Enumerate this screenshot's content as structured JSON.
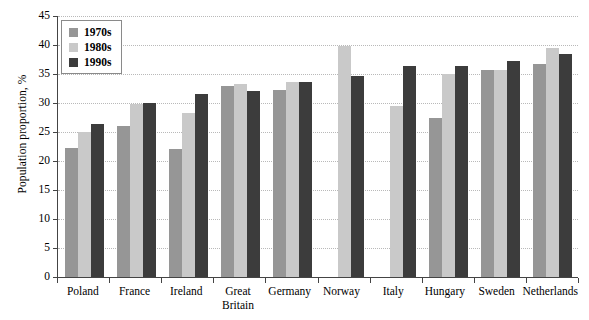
{
  "chart_data": {
    "type": "bar",
    "title": "",
    "xlabel": "",
    "ylabel": "Population proportion, %",
    "ylim": [
      0,
      45
    ],
    "ytick_step": 5,
    "yticks": [
      "45",
      "40",
      "35",
      "30",
      "25",
      "20",
      "15",
      "10",
      "5",
      "0"
    ],
    "grid": true,
    "legend_position": "top-left",
    "categories": [
      "Poland",
      "France",
      "Ireland",
      "Great\nBritain",
      "Germany",
      "Norway",
      "Italy",
      "Hungary",
      "Sweden",
      "Netherlands"
    ],
    "series": [
      {
        "name": "1970s",
        "color": "#969696",
        "values": [
          22.3,
          26.0,
          22.0,
          32.9,
          32.2,
          null,
          null,
          27.4,
          35.7,
          36.8
        ]
      },
      {
        "name": "1980s",
        "color": "#c9c9c9",
        "values": [
          25.0,
          29.8,
          28.2,
          33.2,
          33.6,
          39.8,
          29.4,
          35.0,
          35.7,
          39.5
        ]
      },
      {
        "name": "1990s",
        "color": "#3c3c3c",
        "values": [
          26.4,
          30.0,
          31.6,
          32.0,
          33.6,
          34.6,
          36.3,
          36.4,
          37.2,
          38.4
        ]
      }
    ]
  },
  "axis": {
    "y_title": "Population proportion, %"
  },
  "legend": {
    "items": [
      {
        "label": "1970s",
        "color": "#969696"
      },
      {
        "label": "1980s",
        "color": "#c9c9c9"
      },
      {
        "label": "1990s",
        "color": "#3c3c3c"
      }
    ]
  }
}
